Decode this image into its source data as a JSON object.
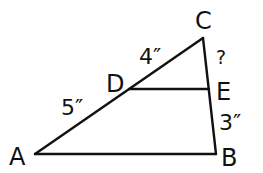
{
  "diagram": {
    "type": "geometry-triangle",
    "colors": {
      "stroke": "#111111",
      "background": "#ffffff"
    },
    "vertices": {
      "A": {
        "label": "A",
        "x": 35,
        "y": 154
      },
      "B": {
        "label": "B",
        "x": 216,
        "y": 154
      },
      "C": {
        "label": "C",
        "x": 203,
        "y": 38
      },
      "D": {
        "label": "D",
        "x": 129,
        "y": 89
      },
      "E": {
        "label": "E",
        "x": 209,
        "y": 89
      }
    },
    "segments": [
      {
        "from": "A",
        "to": "C",
        "name": "side-AC"
      },
      {
        "from": "C",
        "to": "B",
        "name": "side-CB"
      },
      {
        "from": "A",
        "to": "B",
        "name": "side-AB"
      },
      {
        "from": "D",
        "to": "E",
        "name": "segment-DE"
      }
    ],
    "measurements": {
      "CD": "4″",
      "DA": "5″",
      "EB": "3″",
      "CE": "?"
    }
  }
}
